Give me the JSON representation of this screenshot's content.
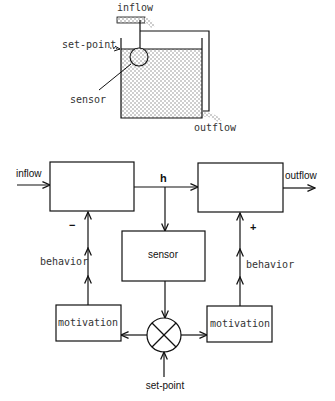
{
  "tank": {
    "inflow_label": "inflow",
    "setpoint_label": "set-point",
    "sensor_label": "sensor",
    "outflow_label": "outflow"
  },
  "block_diagram": {
    "inflow_label": "inflow",
    "outflow_label": "outflow",
    "h_label": "h",
    "sensor_label": "sensor",
    "left_motivation_label": "motivation",
    "right_motivation_label": "motivation",
    "left_behavior_label": "behavior",
    "right_behavior_label": "behavior",
    "minus_sign": "−",
    "plus_sign": "+",
    "setpoint_label": "set-point"
  },
  "colors": {
    "line": "#111111",
    "stipple": "#888888",
    "background": "#ffffff"
  }
}
